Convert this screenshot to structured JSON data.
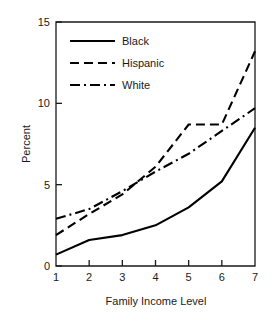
{
  "chart_data": {
    "type": "line",
    "title": "",
    "xlabel": "Family Income Level",
    "ylabel": "Percent",
    "x": [
      1,
      2,
      3,
      4,
      5,
      6,
      7
    ],
    "categories": [
      "1",
      "2",
      "3",
      "4",
      "5",
      "6",
      "7"
    ],
    "xlim": [
      1,
      7
    ],
    "ylim": [
      0,
      15
    ],
    "xticks": [
      "1",
      "2",
      "3",
      "4",
      "5",
      "6",
      "7"
    ],
    "yticks": [
      "0",
      "5",
      "10",
      "15"
    ],
    "ytick_values": [
      0,
      5,
      10,
      15
    ],
    "grid": false,
    "legend_position": "upper-left-inside",
    "series": [
      {
        "name": "Black",
        "style": "solid",
        "values": [
          0.7,
          1.6,
          1.9,
          2.5,
          3.6,
          5.2,
          8.5
        ]
      },
      {
        "name": "Hispanic",
        "style": "dashed",
        "values": [
          1.9,
          3.2,
          4.4,
          6.1,
          8.7,
          8.7,
          13.2
        ]
      },
      {
        "name": "White",
        "style": "dash-dot",
        "values": [
          2.9,
          3.5,
          4.6,
          5.8,
          6.9,
          8.3,
          9.7
        ]
      }
    ]
  },
  "axes": {
    "y_title": "Percent",
    "x_title": "Family Income Level",
    "y_ticks": [
      "0",
      "5",
      "10",
      "15"
    ],
    "x_ticks": [
      "1",
      "2",
      "3",
      "4",
      "5",
      "6",
      "7"
    ]
  },
  "legend": {
    "entries": [
      {
        "label": "Black",
        "style": "solid"
      },
      {
        "label": "Hispanic",
        "style": "dashed"
      },
      {
        "label": "White",
        "style": "dash-dot"
      }
    ]
  },
  "colors": {
    "ink": "#1a1a1a",
    "line": "#000000",
    "background": "#ffffff"
  }
}
